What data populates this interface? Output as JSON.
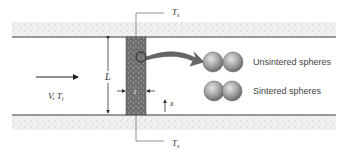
{
  "diagram": {
    "labels": {
      "top_temperature": "T",
      "top_temperature_sub": "s",
      "bottom_temperature": "T",
      "bottom_temperature_sub": "s",
      "length": "L",
      "thickness": "t",
      "axis": "x",
      "inflow": "V, T",
      "inflow_sub": "i",
      "unsintered": "Unsintered spheres",
      "sintered": "Sintered spheres"
    },
    "colors": {
      "wall_stipple": "#d0d0d0",
      "porous_plug": "#7a7a7a",
      "spheres": "#9a9a9a",
      "lines": "#333333"
    }
  }
}
